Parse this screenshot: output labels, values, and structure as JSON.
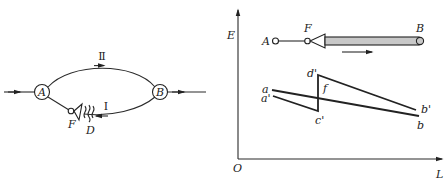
{
  "left_diagram": {
    "node_a": "A",
    "node_b": "B",
    "upper_path_label": "Ⅱ",
    "lower_path_label": "Ⅰ",
    "valve_label": "F",
    "disturbance_label": "D"
  },
  "right_diagram": {
    "y_axis_label": "E",
    "x_axis_label": "L",
    "origin_label": "O",
    "pipe": {
      "start_label": "A",
      "valve_label": "F",
      "end_label": "B",
      "fill_color": "#c8c8c8"
    },
    "line_labels": {
      "a": "a",
      "a_prime": "a'",
      "b": "b",
      "b_prime": "b'",
      "c_prime": "c'",
      "d_prime": "d'",
      "f": "f"
    }
  }
}
